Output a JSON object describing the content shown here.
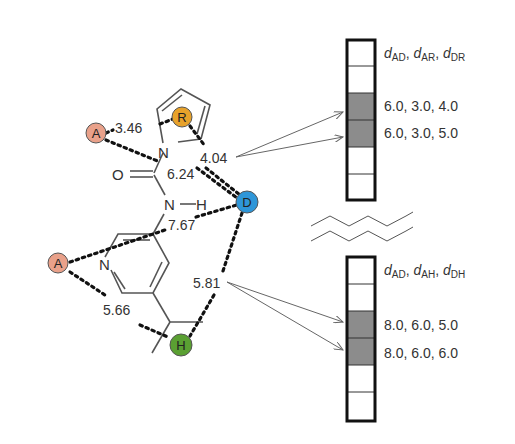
{
  "features": {
    "A1": {
      "label": "A",
      "color": "#E9A18A"
    },
    "R": {
      "label": "R",
      "color": "#E7A22B"
    },
    "D": {
      "label": "D",
      "color": "#2E96D8"
    },
    "A2": {
      "label": "A",
      "color": "#E9A18A"
    },
    "H": {
      "label": "H",
      "color": "#5AA032"
    }
  },
  "atoms": {
    "n_pyrrole": "N",
    "o_carbonyl": "O",
    "n_amide": "N",
    "h_amide": "H",
    "n_pyridine": "N"
  },
  "distances": {
    "A_R": "3.46",
    "A_D": "6.24",
    "R_D": "4.04",
    "A_D_lower": "7.67",
    "D_H": "5.81",
    "A_H": "5.66"
  },
  "bins_top": {
    "header": {
      "d1": "d",
      "s1": "AD",
      "d2": "d",
      "s2": "AR",
      "d3": "d",
      "s3": "DR"
    },
    "rows": [
      "6.0, 3.0, 4.0",
      "6.0, 3.0, 5.0"
    ]
  },
  "bins_bottom": {
    "header": {
      "d1": "d",
      "s1": "AD",
      "d2": "d",
      "s2": "AH",
      "d3": "d",
      "s3": "DH"
    },
    "rows": [
      "8.0, 6.0, 5.0",
      "8.0, 6.0, 6.0"
    ]
  },
  "colors": {
    "bin_fill": "#8c8c8c",
    "bond": "#555555",
    "dots": "#111111"
  }
}
